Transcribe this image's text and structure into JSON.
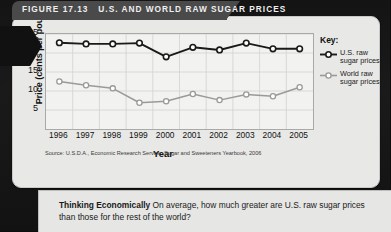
{
  "figure": {
    "number": "FIGURE 17.13",
    "title": "U.S. AND WORLD RAW SUGAR PRICES"
  },
  "source": "Source: U.S.D.A., Economic Research Service, Sugar and Sweeteners Yearbook, 2006",
  "key": {
    "title": "Key:",
    "items": [
      {
        "label": "U.S. raw sugar prices",
        "color": "#1a1a1a"
      },
      {
        "label": "World raw sugar prices",
        "color": "#9a9a9a"
      }
    ]
  },
  "caption": {
    "heading": "Thinking Economically",
    "body": "On average, how much greater are U.S. raw sugar prices than those for the rest of the world?"
  },
  "chart_data": {
    "type": "line",
    "title": "U.S. and World Raw Sugar Prices",
    "xlabel": "Year",
    "ylabel": "Price (cents per pound)",
    "categories": [
      "1996",
      "1997",
      "1998",
      "1999",
      "2000",
      "2001",
      "2002",
      "2003",
      "2004",
      "2005"
    ],
    "xticklabels": [
      "1996",
      "1997",
      "1998",
      "1999",
      "2000",
      "2001",
      "2002",
      "2003",
      "2004",
      "2005"
    ],
    "yticklabels": [
      "5",
      "10",
      "15",
      "20",
      "25"
    ],
    "ytickvalues": [
      5,
      10,
      15,
      20,
      25
    ],
    "ylim": [
      0,
      25
    ],
    "grid": true,
    "legend_position": "right",
    "series": [
      {
        "name": "U.S. raw sugar prices",
        "color": "#1a1a1a",
        "values": [
          22.7,
          22.4,
          22.4,
          22.6,
          19.0,
          21.5,
          20.8,
          22.6,
          21.1,
          21.1
        ]
      },
      {
        "name": "World raw sugar prices",
        "color": "#9a9a9a",
        "values": [
          12.5,
          11.5,
          10.7,
          6.9,
          7.3,
          9.2,
          7.6,
          9.1,
          8.6,
          11.0
        ]
      }
    ]
  }
}
